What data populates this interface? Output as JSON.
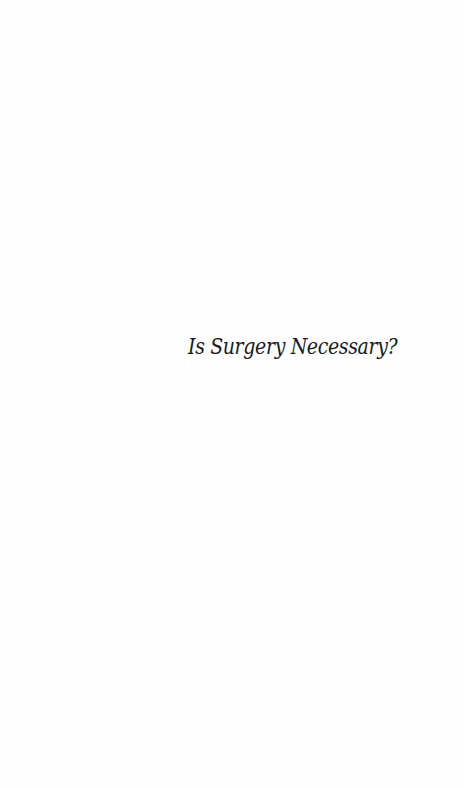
{
  "page": {
    "half_title": "Is Surgery Necessary?"
  }
}
